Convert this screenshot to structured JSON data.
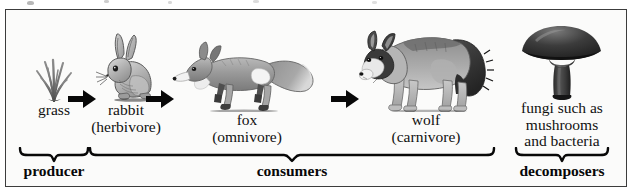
{
  "figure": {
    "type": "food-chain-diagram",
    "border_color": "#3c3c3c",
    "background_color": "#fbfbfa",
    "ink_color": "#080808"
  },
  "chain": {
    "nodes": [
      {
        "id": "grass",
        "icon": "grass-tuft-icon",
        "label_line1": "grass",
        "label_line2": ""
      },
      {
        "id": "rabbit",
        "icon": "rabbit-icon",
        "label_line1": "rabbit",
        "label_line2": "(herbivore)"
      },
      {
        "id": "fox",
        "icon": "fox-icon",
        "label_line1": "fox",
        "label_line2": "(omnivore)"
      },
      {
        "id": "wolf",
        "icon": "wolf-icon",
        "label_line1": "wolf",
        "label_line2": "(carnivore)"
      },
      {
        "id": "fungi",
        "icon": "mushroom-icon",
        "label_line1": "fungi such as",
        "label_line2": "mushrooms",
        "label_line3": "and bacteria"
      }
    ],
    "arrows": [
      {
        "id": "arrow-grass-to-rabbit",
        "from": "grass",
        "to": "rabbit"
      },
      {
        "id": "arrow-rabbit-to-fox",
        "from": "rabbit",
        "to": "fox"
      },
      {
        "id": "arrow-fox-to-wolf",
        "from": "fox",
        "to": "wolf"
      }
    ]
  },
  "groups": [
    {
      "id": "producer",
      "label": "producer",
      "covers": [
        "grass"
      ]
    },
    {
      "id": "consumers",
      "label": "consumers",
      "covers": [
        "rabbit",
        "fox",
        "wolf"
      ]
    },
    {
      "id": "decomposers",
      "label": "decomposers",
      "covers": [
        "fungi"
      ]
    }
  ]
}
